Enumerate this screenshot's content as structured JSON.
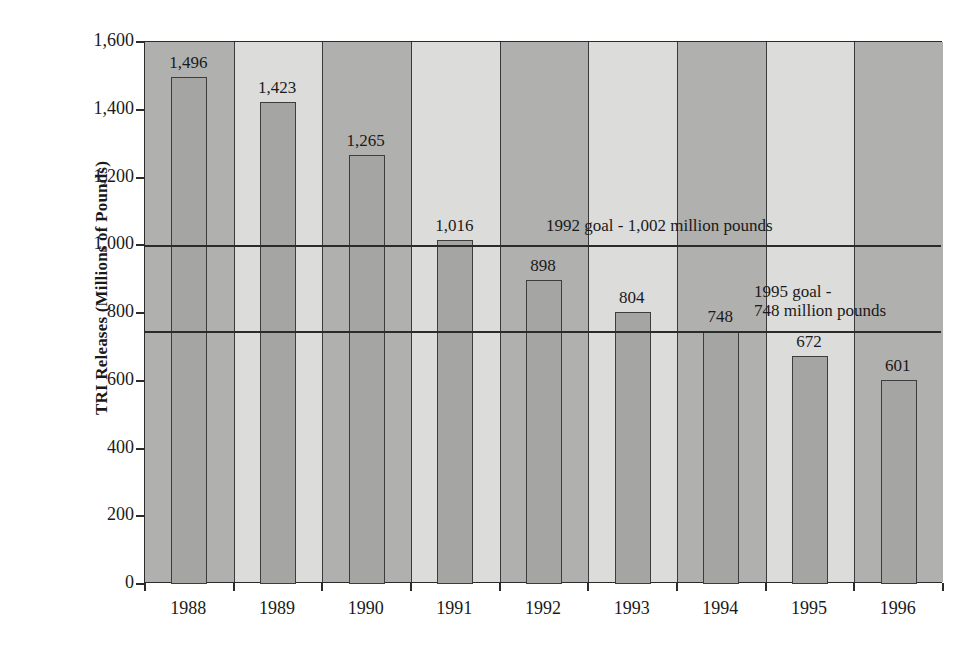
{
  "chart_data": {
    "type": "bar",
    "title": "",
    "xlabel": "",
    "ylabel": "TRI Releases (Millions of Pounds)",
    "categories": [
      "1988",
      "1989",
      "1990",
      "1991",
      "1992",
      "1993",
      "1994",
      "1995",
      "1996"
    ],
    "values": [
      1496,
      1423,
      1265,
      1016,
      898,
      804,
      748,
      672,
      601
    ],
    "value_labels": [
      "1,496",
      "1,423",
      "1,265",
      "1,016",
      "898",
      "804",
      "748",
      "672",
      "601"
    ],
    "ylim": [
      0,
      1600
    ],
    "y_ticks": [
      0,
      200,
      400,
      600,
      800,
      1000,
      1200,
      1400,
      1600
    ],
    "y_tick_labels": [
      "0",
      "200",
      "400",
      "600",
      "800",
      "1,000",
      "1,200",
      "1,400",
      "1,600"
    ],
    "grid": false,
    "legend": "none",
    "bar_color": "#a5a5a3",
    "bar_edge_color": "#3d3d3d",
    "plot_background": "#dcdcdb",
    "band_color": "#b0b0ae",
    "annotations": [
      {
        "name": "goal-1992",
        "value": 1002,
        "text": "1992 goal - 1,002 million pounds",
        "lines": [
          "1992 goal - 1,002 million pounds"
        ]
      },
      {
        "name": "goal-1995",
        "value": 748,
        "text": "1995 goal - 748 million pounds",
        "lines": [
          "1995 goal -",
          "748 million pounds"
        ]
      }
    ]
  },
  "axis": {
    "y_title": "TRI Releases (Millions of Pounds)",
    "y_labels": [
      "1,600",
      "1,400",
      "1,200",
      "1,000",
      "800",
      "600",
      "400",
      "200",
      "0"
    ],
    "x_labels": [
      "1988",
      "1989",
      "1990",
      "1991",
      "1992",
      "1993",
      "1994",
      "1995",
      "1996"
    ]
  },
  "bars": [
    {
      "year": "1988",
      "value": 1496,
      "label": "1,496"
    },
    {
      "year": "1989",
      "value": 1423,
      "label": "1,423"
    },
    {
      "year": "1990",
      "value": 1265,
      "label": "1,265"
    },
    {
      "year": "1991",
      "value": 1016,
      "label": "1,016"
    },
    {
      "year": "1992",
      "value": 898,
      "label": "898"
    },
    {
      "year": "1993",
      "value": 804,
      "label": "804"
    },
    {
      "year": "1994",
      "value": 748,
      "label": "748"
    },
    {
      "year": "1995",
      "value": 672,
      "label": "672"
    },
    {
      "year": "1996",
      "value": 601,
      "label": "601"
    }
  ],
  "goals": {
    "goal_1992_line1": "1992 goal - 1,002 million pounds",
    "goal_1995_line1": "1995 goal -",
    "goal_1995_line2": "748 million pounds"
  }
}
